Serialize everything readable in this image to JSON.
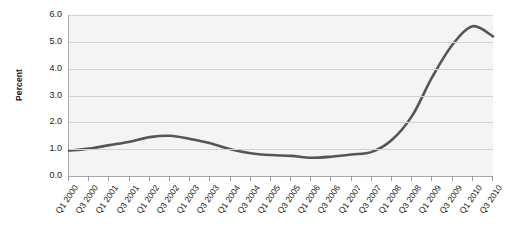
{
  "chart_data": {
    "type": "line",
    "title": "",
    "xlabel": "",
    "ylabel": "Percent",
    "ylim": [
      0.0,
      6.0
    ],
    "ytick_labels": [
      "6.0",
      "5.0",
      "4.0",
      "3.0",
      "2.0",
      "1.0",
      "0.0"
    ],
    "ytick_values": [
      6.0,
      5.0,
      4.0,
      3.0,
      2.0,
      1.0,
      0.0
    ],
    "grid": true,
    "legend": "none",
    "categories": [
      "Q1 2000",
      "Q3 2000",
      "Q1 2001",
      "Q3 2001",
      "Q1 2002",
      "Q3 2002",
      "Q1 2003",
      "Q3 2003",
      "Q1 2004",
      "Q3 2004",
      "Q1 2005",
      "Q3 2005",
      "Q1 2006",
      "Q3 2006",
      "Q1 2007",
      "Q3 2007",
      "Q1 2008",
      "Q3 2008",
      "Q1 2009",
      "Q3 2009",
      "Q1 2010",
      "Q3 2010"
    ],
    "values": [
      0.95,
      1.02,
      1.15,
      1.28,
      1.45,
      1.5,
      1.38,
      1.22,
      1.0,
      0.85,
      0.78,
      0.75,
      0.68,
      0.72,
      0.8,
      0.9,
      1.35,
      2.25,
      3.7,
      4.9,
      5.58,
      5.2
    ],
    "series_color": "#555555",
    "plot_background": "#f4f4f4",
    "gridline_color": "#d2d2d2",
    "axis_color": "#a8a8a8"
  }
}
